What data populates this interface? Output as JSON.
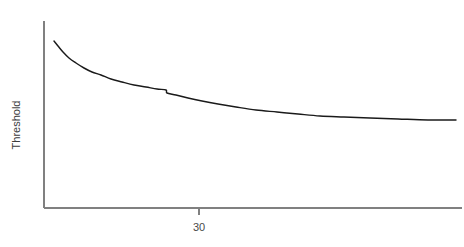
{
  "chart_data": {
    "type": "line",
    "title": "",
    "subtitle": "",
    "xlabel": "",
    "ylabel": "Threshold",
    "grid": false,
    "legend": false,
    "legend_position": "none",
    "background_color": "#ffffff",
    "series_color": "#1a1a1a",
    "axis_color": "#808080",
    "x_ticks": [
      {
        "value": 30,
        "label": "30",
        "pixel_x": 199
      }
    ],
    "y_ticks": [],
    "xlim": [
      20,
      100
    ],
    "ylim": [
      0,
      1
    ],
    "axis_pixels": {
      "x_axis_y": 208,
      "y_axis_x": 44,
      "x_axis_left": 44,
      "x_axis_right": 462,
      "y_axis_top": 21,
      "y_axis_bottom": 208
    },
    "annotations": [
      {
        "name": "discontinuity-kink",
        "description": "small downward step in the curve",
        "pixel_x": 166,
        "pixel_y": 91
      }
    ],
    "series": [
      {
        "name": "threshold-curve",
        "points": [
          [
            54,
            41
          ],
          [
            58,
            46
          ],
          [
            63,
            52
          ],
          [
            69,
            58
          ],
          [
            76,
            63
          ],
          [
            84,
            68
          ],
          [
            92,
            72
          ],
          [
            101,
            75
          ],
          [
            111,
            79
          ],
          [
            122,
            82
          ],
          [
            134,
            85
          ],
          [
            146,
            87
          ],
          [
            157,
            89
          ],
          [
            166,
            90
          ],
          [
            167,
            93
          ],
          [
            176,
            95
          ],
          [
            188,
            98
          ],
          [
            202,
            101
          ],
          [
            218,
            104
          ],
          [
            236,
            107
          ],
          [
            256,
            110
          ],
          [
            277,
            112
          ],
          [
            298,
            114
          ],
          [
            320,
            116
          ],
          [
            344,
            117
          ],
          [
            370,
            118
          ],
          [
            398,
            119
          ],
          [
            428,
            120
          ],
          [
            456,
            120
          ]
        ]
      }
    ]
  },
  "labels": {
    "y_axis_title": "Threshold",
    "x_tick_30": "30",
    "x_axis_caption": ""
  }
}
